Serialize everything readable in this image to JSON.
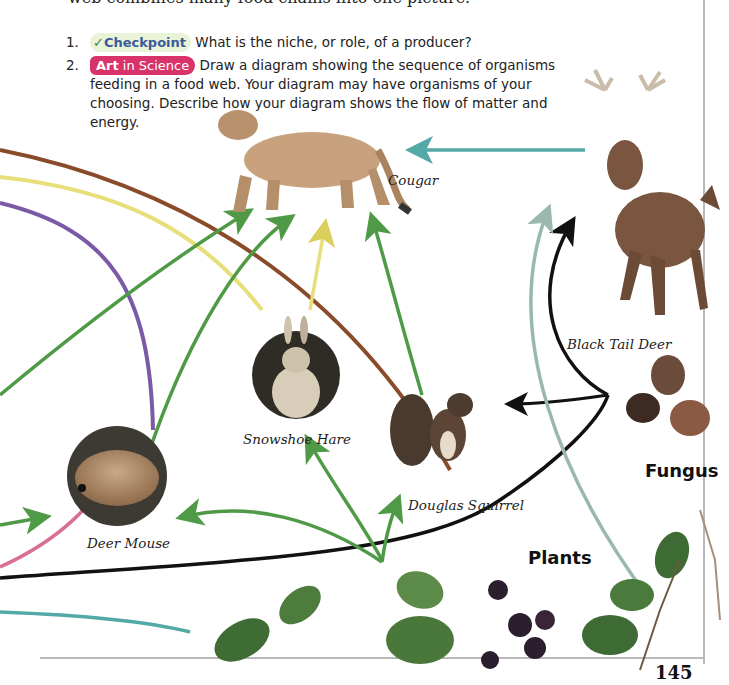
{
  "intro_text": "web combines many food chains into one picture.",
  "questions": [
    {
      "number": "1.",
      "badge": {
        "icon": "checkmark-icon",
        "label": "Checkpoint"
      },
      "text": "What is the niche, or role, of a producer?"
    },
    {
      "number": "2.",
      "badge": {
        "label_bold": "Art",
        "label_rest": " in Science"
      },
      "text": "Draw a diagram showing the sequence of organisms feeding in a food web. Your diagram may have organisms of your choosing. Describe how your diagram shows the flow of matter and energy."
    }
  ],
  "organisms": {
    "cougar": "Cougar",
    "deer": "Black Tail Deer",
    "hare": "Snowshoe Hare",
    "mouse": "Deer Mouse",
    "squirrel": "Douglas Squirrel"
  },
  "groups": {
    "fungus": "Fungus",
    "plants": "Plants"
  },
  "page_number": "145",
  "colors": {
    "arrow_green": "#4f9a46",
    "arrow_brown": "#8a4b2b",
    "arrow_pink": "#d96f93",
    "arrow_purple": "#7a5aa6",
    "arrow_yellow": "#e7df7a",
    "arrow_teal": "#53a9a6",
    "arrow_black": "#111111",
    "arrow_gray": "#a6a6a6",
    "badge_art": "#d9336b"
  }
}
